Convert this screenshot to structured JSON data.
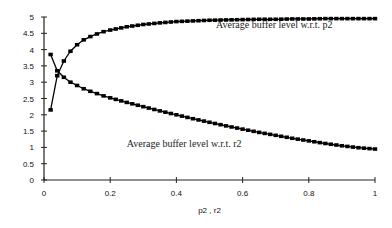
{
  "chart_data": {
    "type": "line",
    "title": "",
    "xlabel": "p2 , r2",
    "ylabel": "",
    "xlim": [
      0,
      1
    ],
    "ylim": [
      0,
      5
    ],
    "grid": false,
    "legend": "none",
    "x_ticks": [
      "0",
      "0.2",
      "0.4",
      "0.6",
      "0.8",
      "1"
    ],
    "y_ticks": [
      "0",
      "0.5",
      "1",
      "1.5",
      "2",
      "2.5",
      "3",
      "3.5",
      "4",
      "4.5",
      "5"
    ],
    "x": [
      0.02,
      0.04,
      0.06,
      0.08,
      0.1,
      0.12,
      0.14,
      0.16,
      0.18,
      0.2,
      0.25,
      0.3,
      0.35,
      0.4,
      0.45,
      0.5,
      0.55,
      0.6,
      0.65,
      0.7,
      0.75,
      0.8,
      0.85,
      0.9,
      0.95,
      1.0
    ],
    "series": [
      {
        "name": "Average buffer level w.r.t. p2",
        "values": [
          2.15,
          3.2,
          3.65,
          3.95,
          4.15,
          4.3,
          4.4,
          4.48,
          4.55,
          4.6,
          4.7,
          4.77,
          4.82,
          4.86,
          4.88,
          4.9,
          4.91,
          4.92,
          4.93,
          4.93,
          4.94,
          4.94,
          4.95,
          4.95,
          4.95,
          4.95
        ]
      },
      {
        "name": "Average buffer level w.r.t. r2",
        "values": [
          3.85,
          3.35,
          3.15,
          3.0,
          2.9,
          2.8,
          2.72,
          2.65,
          2.58,
          2.52,
          2.38,
          2.25,
          2.12,
          2.0,
          1.88,
          1.77,
          1.66,
          1.56,
          1.46,
          1.37,
          1.28,
          1.2,
          1.12,
          1.05,
          0.99,
          0.95
        ]
      }
    ],
    "annotations": [
      {
        "text": "Average buffer level w.r.t. p2",
        "x": 0.52,
        "y": 4.65
      },
      {
        "text": "Average buffer level w.r.t. r2",
        "x": 0.25,
        "y": 1.0
      }
    ]
  }
}
